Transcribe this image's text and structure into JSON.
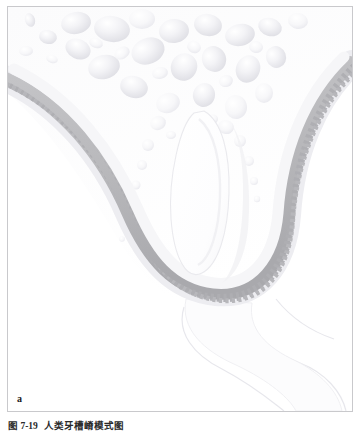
{
  "figure": {
    "panel_letter": "a",
    "caption_number": "图 7-19",
    "caption_text": "人类牙槽嵴模式图",
    "alt_description": "tooth-germ-alveolar-bone-cross-section"
  },
  "colors": {
    "frame_border": "#c9c9cc",
    "page_background": "#ffffff",
    "band_gray": "#bdbdc0",
    "band_gray_dark": "#ababae",
    "trabecula_shade": "#e6e6ea",
    "trabecula_light": "#f4f4f6",
    "bone_field": "#fafafb",
    "faint_outline": "#e9e9ec",
    "caption_text": "#2a2a2a",
    "panel_letter": "#1b1b1b"
  },
  "structures": [
    {
      "id": "trabecular-bone",
      "label": "trabecular bone / marrow spaces"
    },
    {
      "id": "cortical-band",
      "label": "serrated cortical band"
    },
    {
      "id": "tooth-germ-oval",
      "label": "central tooth germ cavity"
    },
    {
      "id": "soft-tissue-outline",
      "label": "faint soft tissue outline"
    }
  ],
  "figure_data": {
    "type": "anatomical-illustration",
    "trabeculae_count": 46,
    "serration_teeth_count": 128,
    "band_stroke_width_px": 13
  }
}
